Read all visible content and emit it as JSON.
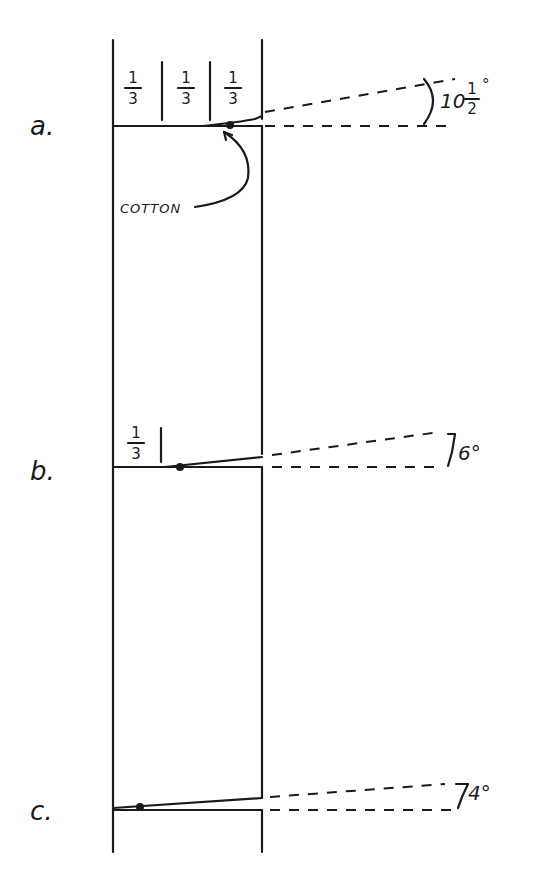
{
  "diagram": {
    "type": "technical-sketch",
    "column": {
      "left_x": 113,
      "right_x": 262,
      "top_y": 40,
      "bottom_y": 852
    },
    "panels": [
      {
        "id": "a",
        "label": "a.",
        "angle_label": "10½°",
        "angle_whole": "10",
        "angle_num": "1",
        "angle_den": "2",
        "fractions": [
          {
            "num": "1",
            "den": "3"
          },
          {
            "num": "1",
            "den": "3"
          },
          {
            "num": "1",
            "den": "3"
          }
        ],
        "annotation": "COTTON"
      },
      {
        "id": "b",
        "label": "b.",
        "angle_label": "6°",
        "fractions": [
          {
            "num": "1",
            "den": "3"
          }
        ]
      },
      {
        "id": "c",
        "label": "c.",
        "angle_label": "4°",
        "fractions": []
      }
    ],
    "degree_symbol": "°"
  }
}
